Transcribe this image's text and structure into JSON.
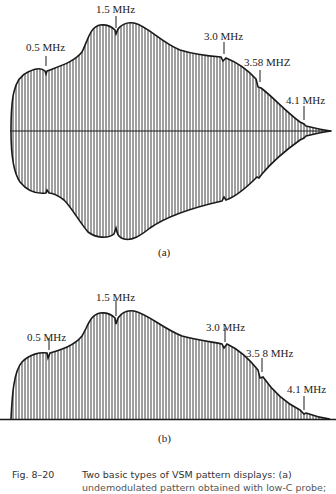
{
  "figure": {
    "number": "Fig. 8–20",
    "caption_line1": "Two basic types of VSM pattern displays: (a)",
    "caption_line2": "undemodulated pattern obtained with low-C probe;",
    "panels": [
      {
        "id": "a",
        "label": "(a)",
        "type": "undemodulated envelope (symmetric about axis)",
        "markers": [
          {
            "text": "0.5 MHz"
          },
          {
            "text": "1.5 MHz"
          },
          {
            "text": "3.0 MHz"
          },
          {
            "text": "3.58 MHZ"
          },
          {
            "text": "4.1 MHz"
          }
        ]
      },
      {
        "id": "b",
        "label": "(b)",
        "type": "demodulated envelope (above baseline)",
        "markers": [
          {
            "text": "0.5 MHz"
          },
          {
            "text": "1.5 MHz"
          },
          {
            "text": "3.0 MHz"
          },
          {
            "text": "3.5 8 MHz"
          },
          {
            "text": "4.1 MHz"
          }
        ]
      }
    ]
  },
  "colors": {
    "ink": "#1a1a1a",
    "hatch": "#2a2a2a",
    "background": "#ffffff"
  }
}
